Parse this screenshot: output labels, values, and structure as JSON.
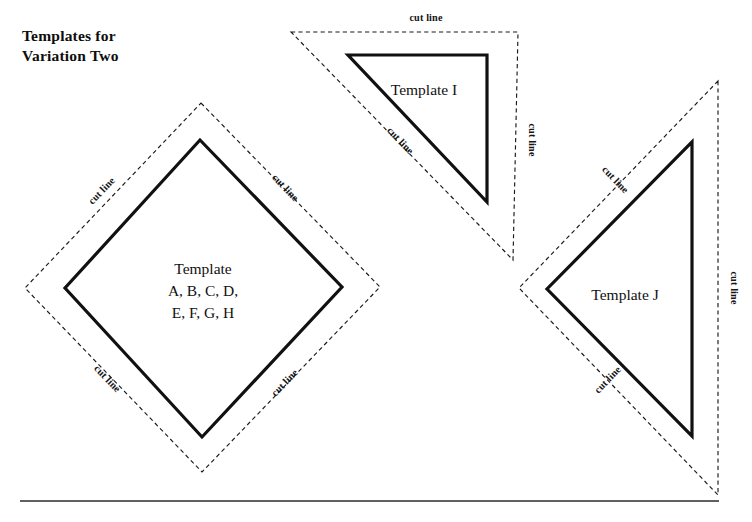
{
  "page": {
    "title": "Templates for\nVariation Two",
    "background_color": "#ffffff",
    "ink_color": "#111111"
  },
  "labels": {
    "cut_line": "cut line"
  },
  "templates": [
    {
      "id": "diamond",
      "name": "Template A-H",
      "shape": "square rotated 45 degrees (diamond)",
      "lines": [
        "Template",
        "A, B, C, D,",
        "E, F, G, H"
      ],
      "solid_points": "200,140 342,287 202,437 65,288",
      "dashed_points": "201,103 380,287 202,472 25,288",
      "cut_labels": [
        {
          "text": "cut line",
          "x": 104,
          "y": 193,
          "rotate": -46
        },
        {
          "text": "cut line",
          "x": 283,
          "y": 190,
          "rotate": 46
        },
        {
          "text": "cut line",
          "x": 105,
          "y": 381,
          "rotate": 46
        },
        {
          "text": "cut line",
          "x": 287,
          "y": 385,
          "rotate": -46
        }
      ]
    },
    {
      "id": "template-i",
      "name": "Template I",
      "shape": "right triangle, right angle top-right",
      "lines": [
        "Template I"
      ],
      "solid_points": "348,55 487,55 487,202",
      "dashed_points": "291,32 518,32 513,260",
      "cut_labels": [
        {
          "text": "cut line",
          "x": 426,
          "y": 21,
          "rotate": 0
        },
        {
          "text": "cut line",
          "x": 398,
          "y": 143,
          "rotate": 46
        },
        {
          "text": "cut line",
          "x": 529,
          "y": 140,
          "rotate": 90
        }
      ]
    },
    {
      "id": "template-j",
      "name": "Template J",
      "shape": "triangle pointing left, vertical right edge",
      "lines": [
        "Template J"
      ],
      "solid_points": "692,142 692,436 547,289",
      "dashed_points": "718,81 718,495 519,288",
      "cut_labels": [
        {
          "text": "cut line",
          "x": 613,
          "y": 182,
          "rotate": 46
        },
        {
          "text": "cut line",
          "x": 610,
          "y": 382,
          "rotate": -46
        },
        {
          "text": "cut line",
          "x": 731,
          "y": 288,
          "rotate": 90
        }
      ]
    }
  ],
  "diamond_text": {
    "line1": "Template",
    "line2": "A, B, C, D,",
    "line3": "E, F, G, H",
    "x": 203,
    "y1": 274,
    "y2": 296,
    "y3": 318
  },
  "template_i_text": {
    "label": "Template I",
    "x": 424,
    "y": 95
  },
  "template_j_text": {
    "label": "Template J",
    "x": 625,
    "y": 300
  },
  "baseline": {
    "x1": 20,
    "x2": 719,
    "y": 501
  }
}
